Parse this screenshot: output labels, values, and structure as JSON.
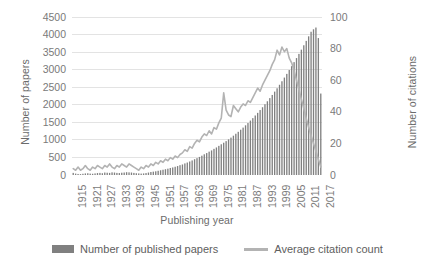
{
  "chart_data": {
    "type": "bar",
    "title": "",
    "xlabel": "Publishing year",
    "ylabel": "Number of papers",
    "ylabel_secondary": "Number of citations",
    "ylim": [
      0,
      4500
    ],
    "ylim_secondary": [
      0,
      100
    ],
    "grid": true,
    "legend_position": "bottom",
    "y_ticks": [
      "0",
      "500",
      "1000",
      "1500",
      "2000",
      "2500",
      "3000",
      "3500",
      "4000",
      "4500"
    ],
    "y_ticks_secondary": [
      "0",
      "20",
      "40",
      "60",
      "80",
      "100"
    ],
    "x_ticks": [
      "1915",
      "1921",
      "1927",
      "1933",
      "1939",
      "1945",
      "1951",
      "1957",
      "1963",
      "1969",
      "1975",
      "1981",
      "1987",
      "1993",
      "1999",
      "2005",
      "2011",
      "2017"
    ],
    "colors": {
      "bars": "#808080",
      "line": "#b3b3b3",
      "grid": "#e3e3e3",
      "text": "#7a7a7a"
    },
    "categories": [
      1915,
      1916,
      1917,
      1918,
      1919,
      1920,
      1921,
      1922,
      1923,
      1924,
      1925,
      1926,
      1927,
      1928,
      1929,
      1930,
      1931,
      1932,
      1933,
      1934,
      1935,
      1936,
      1937,
      1938,
      1939,
      1940,
      1941,
      1942,
      1943,
      1944,
      1945,
      1946,
      1947,
      1948,
      1949,
      1950,
      1951,
      1952,
      1953,
      1954,
      1955,
      1956,
      1957,
      1958,
      1959,
      1960,
      1961,
      1962,
      1963,
      1964,
      1965,
      1966,
      1967,
      1968,
      1969,
      1970,
      1971,
      1972,
      1973,
      1974,
      1975,
      1976,
      1977,
      1978,
      1979,
      1980,
      1981,
      1982,
      1983,
      1984,
      1985,
      1986,
      1987,
      1988,
      1989,
      1990,
      1991,
      1992,
      1993,
      1994,
      1995,
      1996,
      1997,
      1998,
      1999,
      2000,
      2001,
      2002,
      2003,
      2004,
      2005,
      2006,
      2007,
      2008,
      2009,
      2010,
      2011,
      2012,
      2013,
      2014,
      2015,
      2016,
      2017
    ],
    "series": [
      {
        "name": "Number of published papers",
        "type": "bar",
        "axis": "left",
        "color": "#808080",
        "values": [
          60,
          40,
          30,
          25,
          35,
          45,
          50,
          40,
          35,
          45,
          55,
          60,
          50,
          70,
          65,
          60,
          75,
          70,
          60,
          55,
          65,
          70,
          80,
          75,
          70,
          60,
          50,
          45,
          40,
          45,
          55,
          70,
          85,
          95,
          105,
          120,
          135,
          150,
          165,
          180,
          200,
          215,
          235,
          255,
          280,
          300,
          330,
          355,
          385,
          415,
          450,
          480,
          515,
          550,
          590,
          625,
          665,
          700,
          745,
          785,
          830,
          875,
          920,
          965,
          1015,
          1065,
          1120,
          1175,
          1230,
          1290,
          1350,
          1415,
          1480,
          1550,
          1620,
          1695,
          1770,
          1850,
          1930,
          2015,
          2100,
          2190,
          2280,
          2375,
          2470,
          2570,
          2670,
          2775,
          2880,
          2990,
          3100,
          3215,
          3330,
          3450,
          3570,
          3695,
          3820,
          3950,
          4080,
          4150,
          4200,
          3900,
          2320
        ]
      },
      {
        "name": "Average citation count",
        "type": "line",
        "axis": "right",
        "color": "#b3b3b3",
        "values": [
          4,
          3,
          5,
          3,
          4,
          6,
          4,
          3,
          5,
          4,
          6,
          5,
          4,
          6,
          5,
          7,
          5,
          4,
          6,
          5,
          7,
          6,
          5,
          7,
          6,
          5,
          4,
          3,
          5,
          4,
          6,
          5,
          7,
          6,
          8,
          7,
          9,
          8,
          10,
          9,
          11,
          10,
          12,
          11,
          13,
          14,
          16,
          15,
          18,
          17,
          20,
          22,
          21,
          24,
          26,
          25,
          28,
          26,
          30,
          29,
          33,
          36,
          52,
          41,
          38,
          37,
          44,
          42,
          40,
          43,
          45,
          44,
          47,
          46,
          49,
          52,
          55,
          53,
          57,
          60,
          63,
          66,
          70,
          73,
          79,
          76,
          81,
          78,
          80,
          74,
          71,
          66,
          60,
          54,
          48,
          42,
          36,
          30,
          25,
          20,
          15,
          10,
          5
        ]
      }
    ]
  },
  "axes": {
    "y_left_title": "Number of papers",
    "y_right_title": "Number of citations",
    "x_title": "Publishing year"
  },
  "legend": {
    "bars_label": "Number of published papers",
    "line_label": "Average citation count"
  }
}
